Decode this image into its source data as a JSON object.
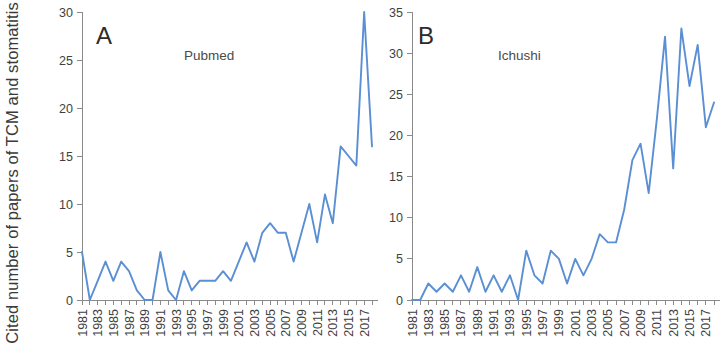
{
  "figure": {
    "y_axis_title": "Cited number of papers of TCM and stomatitis",
    "background_color": "#ffffff",
    "line_color": "#5b8fd4",
    "axis_color": "#8a8a8a"
  },
  "panels": [
    {
      "letter": "A",
      "title": "Pubmed"
    },
    {
      "letter": "B",
      "title": "Ichushi"
    }
  ],
  "chart_data": [
    {
      "type": "line",
      "title": "Pubmed",
      "panel_letter": "A",
      "xlabel": "",
      "ylabel": "Cited number of papers of TCM and stomatitis",
      "ylim": [
        0,
        30
      ],
      "xlim": [
        1981,
        2018
      ],
      "ytick_labels": [
        "0",
        "5",
        "10",
        "15",
        "20",
        "25",
        "30"
      ],
      "yticks": [
        0,
        5,
        10,
        15,
        20,
        25,
        30
      ],
      "xticks": [
        1981,
        1982,
        1983,
        1984,
        1985,
        1986,
        1987,
        1988,
        1989,
        1990,
        1991,
        1992,
        1993,
        1994,
        1995,
        1996,
        1997,
        1998,
        1999,
        2000,
        2001,
        2002,
        2003,
        2004,
        2005,
        2006,
        2007,
        2008,
        2009,
        2010,
        2011,
        2012,
        2013,
        2014,
        2015,
        2016,
        2017,
        2018
      ],
      "xtick_labels": [
        "1981",
        "",
        "1983",
        "",
        "1985",
        "",
        "1987",
        "",
        "1989",
        "",
        "1991",
        "",
        "1993",
        "",
        "1995",
        "",
        "1997",
        "",
        "1999",
        "",
        "2001",
        "",
        "2003",
        "",
        "2005",
        "",
        "2007",
        "",
        "2009",
        "",
        "2011",
        "",
        "2013",
        "",
        "2015",
        "",
        "2017",
        ""
      ],
      "grid": false,
      "legend": "none",
      "x": [
        1981,
        1982,
        1983,
        1984,
        1985,
        1986,
        1987,
        1988,
        1989,
        1990,
        1991,
        1992,
        1993,
        1994,
        1995,
        1996,
        1997,
        1998,
        1999,
        2000,
        2001,
        2002,
        2003,
        2004,
        2005,
        2006,
        2007,
        2008,
        2009,
        2010,
        2011,
        2012,
        2013,
        2014,
        2015,
        2016,
        2017,
        2018
      ],
      "values": [
        5,
        0,
        2,
        4,
        2,
        4,
        3,
        1,
        0,
        0,
        5,
        1,
        0,
        3,
        1,
        2,
        2,
        2,
        3,
        2,
        4,
        6,
        4,
        7,
        8,
        7,
        7,
        4,
        7,
        10,
        6,
        11,
        8,
        16,
        15,
        14,
        30,
        16
      ]
    },
    {
      "type": "line",
      "title": "Ichushi",
      "panel_letter": "B",
      "xlabel": "",
      "ylabel": "",
      "ylim": [
        0,
        35
      ],
      "xlim": [
        1981,
        2018
      ],
      "ytick_labels": [
        "0",
        "5",
        "10",
        "15",
        "20",
        "25",
        "30",
        "35"
      ],
      "yticks": [
        0,
        5,
        10,
        15,
        20,
        25,
        30,
        35
      ],
      "xticks": [
        1981,
        1982,
        1983,
        1984,
        1985,
        1986,
        1987,
        1988,
        1989,
        1990,
        1991,
        1992,
        1993,
        1994,
        1995,
        1996,
        1997,
        1998,
        1999,
        2000,
        2001,
        2002,
        2003,
        2004,
        2005,
        2006,
        2007,
        2008,
        2009,
        2010,
        2011,
        2012,
        2013,
        2014,
        2015,
        2016,
        2017,
        2018
      ],
      "xtick_labels": [
        "1981",
        "",
        "1983",
        "",
        "1985",
        "",
        "1987",
        "",
        "1989",
        "",
        "1991",
        "",
        "1993",
        "",
        "1995",
        "",
        "1997",
        "",
        "1999",
        "",
        "2001",
        "",
        "2003",
        "",
        "2005",
        "",
        "2007",
        "",
        "2009",
        "",
        "2011",
        "",
        "2013",
        "",
        "2015",
        "",
        "2017",
        ""
      ],
      "grid": false,
      "legend": "none",
      "x": [
        1981,
        1982,
        1983,
        1984,
        1985,
        1986,
        1987,
        1988,
        1989,
        1990,
        1991,
        1992,
        1993,
        1994,
        1995,
        1996,
        1997,
        1998,
        1999,
        2000,
        2001,
        2002,
        2003,
        2004,
        2005,
        2006,
        2007,
        2008,
        2009,
        2010,
        2011,
        2012,
        2013,
        2014,
        2015,
        2016,
        2017,
        2018
      ],
      "values": [
        0,
        0,
        2,
        1,
        2,
        1,
        3,
        1,
        4,
        1,
        3,
        1,
        3,
        0,
        6,
        3,
        2,
        6,
        5,
        2,
        5,
        3,
        5,
        8,
        7,
        7,
        11,
        17,
        19,
        13,
        22,
        32,
        16,
        33,
        26,
        31,
        21,
        24
      ]
    }
  ]
}
